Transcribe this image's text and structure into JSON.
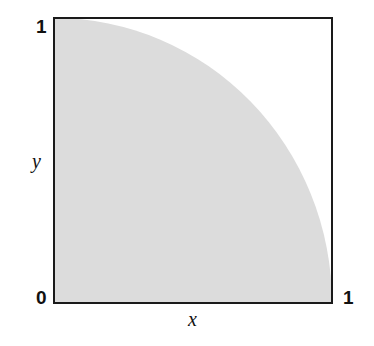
{
  "diagram": {
    "x_label": "x",
    "y_label": "y",
    "ticks": {
      "origin": "0",
      "x_max": "1",
      "y_max": "1"
    },
    "colors": {
      "fill": "#dcdcdc",
      "frame": "#1a1a1a",
      "background": "#ffffff"
    }
  }
}
